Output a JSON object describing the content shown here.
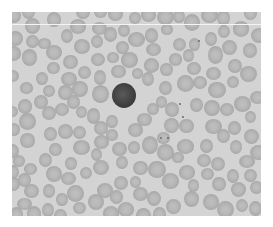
{
  "image": {
    "subject": "blood smear micrograph",
    "description": "Grayscale micrograph of red blood cells with a single dark-stained lymphocyte near center",
    "colors": {
      "background": "#d3d3d3",
      "cell": "#b4b4b4",
      "lymphocyte": "#3e3e3e",
      "border": "#ffffff"
    }
  }
}
